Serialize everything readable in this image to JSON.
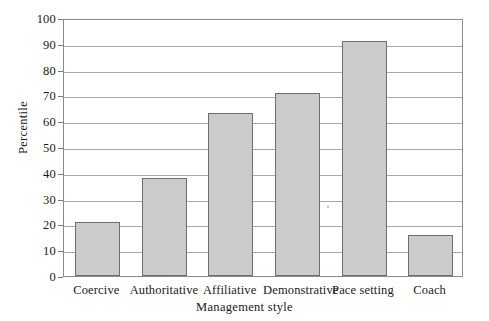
{
  "chart_data": {
    "type": "bar",
    "title": "",
    "xlabel": "Management style",
    "ylabel": "Percentile",
    "categories": [
      "Coercive",
      "Authoritative",
      "Affiliative",
      "Demonstrative",
      "Pace setting",
      "Coach"
    ],
    "values": [
      21,
      38,
      63,
      71,
      91,
      16
    ],
    "ylim": [
      0,
      100
    ],
    "yticks": [
      0,
      10,
      20,
      30,
      40,
      50,
      60,
      70,
      80,
      90,
      100
    ],
    "ytick_labels": [
      "0",
      "10",
      "20",
      "30",
      "40",
      "50",
      "60",
      "70",
      "80",
      "90",
      "100"
    ],
    "grid": true,
    "grid_axis": "y",
    "legend": false,
    "bar_fill": "#cbcbcb",
    "bar_edge": "#6e6e6e",
    "background": "#ffffff",
    "frame": true
  }
}
